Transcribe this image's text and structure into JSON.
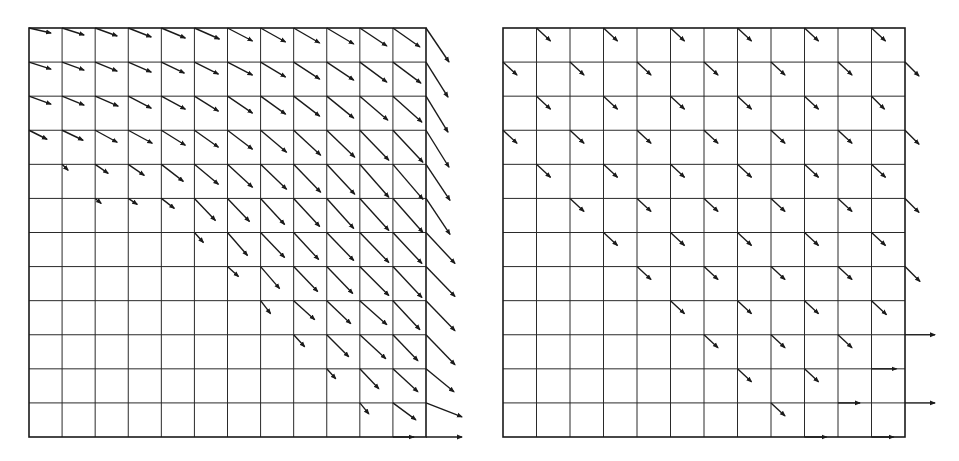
{
  "figure": {
    "stroke_color": "#1a1a1a",
    "background": "#ffffff",
    "panels": [
      {
        "id": "left",
        "name": "dense-vector-field",
        "x0": 29,
        "y0": 28,
        "x1": 426,
        "y1": 437,
        "cols": 12,
        "rows": 12,
        "nodes_comment": "vectors[row][col] = [dx, dy] in px, row 0 = top; null = no arrow",
        "vectors": [
          [
            [
              22,
              5
            ],
            [
              22,
              7
            ],
            [
              22,
              8
            ],
            [
              23,
              9
            ],
            [
              24,
              10
            ],
            [
              25,
              11
            ],
            [
              25,
              13
            ],
            [
              25,
              14
            ],
            [
              26,
              15
            ],
            [
              27,
              16
            ],
            [
              27,
              18
            ],
            [
              27,
              19
            ],
            [
              23,
              34
            ]
          ],
          [
            [
              22,
              7
            ],
            [
              22,
              8
            ],
            [
              22,
              9
            ],
            [
              23,
              10
            ],
            [
              23,
              11
            ],
            [
              24,
              12
            ],
            [
              25,
              13
            ],
            [
              25,
              15
            ],
            [
              26,
              17
            ],
            [
              27,
              18
            ],
            [
              27,
              20
            ],
            [
              28,
              21
            ],
            [
              22,
              35
            ]
          ],
          [
            [
              22,
              8
            ],
            [
              22,
              9
            ],
            [
              23,
              10
            ],
            [
              23,
              12
            ],
            [
              24,
              13
            ],
            [
              24,
              15
            ],
            [
              25,
              17
            ],
            [
              25,
              18
            ],
            [
              26,
              20
            ],
            [
              27,
              22
            ],
            [
              28,
              24
            ],
            [
              29,
              26
            ],
            [
              22,
              36
            ]
          ],
          [
            [
              18,
              9
            ],
            [
              21,
              10
            ],
            [
              22,
              12
            ],
            [
              24,
              13
            ],
            [
              24,
              15
            ],
            [
              24,
              17
            ],
            [
              25,
              19
            ],
            [
              26,
              22
            ],
            [
              27,
              25
            ],
            [
              28,
              27
            ],
            [
              29,
              30
            ],
            [
              30,
              32
            ],
            [
              23,
              37
            ]
          ],
          [
            null,
            [
              6,
              6
            ],
            [
              13,
              9
            ],
            [
              16,
              11
            ],
            [
              22,
              17
            ],
            [
              24,
              20
            ],
            [
              25,
              23
            ],
            [
              26,
              25
            ],
            [
              27,
              28
            ],
            [
              28,
              30
            ],
            [
              29,
              33
            ],
            [
              30,
              35
            ],
            [
              24,
              36
            ]
          ],
          [
            null,
            null,
            [
              6,
              5
            ],
            [
              9,
              6
            ],
            [
              13,
              10
            ],
            [
              21,
              22
            ],
            [
              22,
              23
            ],
            [
              24,
              26
            ],
            [
              26,
              28
            ],
            [
              27,
              30
            ],
            [
              29,
              32
            ],
            [
              30,
              34
            ],
            [
              24,
              36
            ]
          ],
          [
            null,
            null,
            null,
            null,
            null,
            [
              9,
              10
            ],
            [
              20,
              23
            ],
            [
              24,
              25
            ],
            [
              25,
              27
            ],
            [
              27,
              28
            ],
            [
              29,
              30
            ],
            [
              29,
              31
            ],
            [
              29,
              31
            ]
          ],
          [
            null,
            null,
            null,
            null,
            null,
            null,
            [
              11,
              10
            ],
            [
              19,
              22
            ],
            [
              24,
              25
            ],
            [
              26,
              27
            ],
            [
              29,
              29
            ],
            [
              29,
              31
            ],
            [
              29,
              30
            ]
          ],
          [
            null,
            null,
            null,
            null,
            null,
            null,
            null,
            [
              10,
              13
            ],
            [
              21,
              19
            ],
            [
              24,
              23
            ],
            [
              27,
              24
            ],
            [
              27,
              29
            ],
            [
              29,
              30
            ]
          ],
          [
            null,
            null,
            null,
            null,
            null,
            null,
            null,
            null,
            [
              11,
              12
            ],
            [
              22,
              22
            ],
            [
              26,
              24
            ],
            [
              25,
              26
            ],
            [
              29,
              30
            ]
          ],
          [
            null,
            null,
            null,
            null,
            null,
            null,
            null,
            null,
            null,
            [
              9,
              10
            ],
            [
              19,
              20
            ],
            [
              25,
              23
            ],
            [
              28,
              23
            ]
          ],
          [
            null,
            null,
            null,
            null,
            null,
            null,
            null,
            null,
            null,
            null,
            [
              9,
              11
            ],
            [
              23,
              17
            ],
            [
              36,
              14
            ]
          ],
          [
            null,
            null,
            null,
            null,
            null,
            null,
            null,
            null,
            null,
            null,
            [
              0,
              0
            ],
            [
              21,
              0
            ],
            [
              36,
              0
            ]
          ]
        ]
      },
      {
        "id": "right",
        "name": "staggered-vector-field",
        "x0": 503,
        "y0": 28,
        "x1": 905,
        "y1": 437,
        "cols": 12,
        "rows": 12,
        "nodes_comment": "vectors[row][col] = [dx, dy] in px, row 0 = top; null = no arrow",
        "vectors": [
          [
            null,
            [
              14,
              13
            ],
            null,
            [
              14,
              13
            ],
            null,
            [
              14,
              13
            ],
            null,
            [
              14,
              13
            ],
            null,
            [
              14,
              13
            ],
            null,
            [
              14,
              13
            ],
            null
          ],
          [
            [
              14,
              13
            ],
            null,
            [
              14,
              13
            ],
            null,
            [
              14,
              13
            ],
            null,
            [
              14,
              13
            ],
            null,
            [
              14,
              13
            ],
            null,
            [
              14,
              13
            ],
            null,
            [
              14,
              14
            ]
          ],
          [
            null,
            [
              14,
              13
            ],
            null,
            [
              14,
              13
            ],
            null,
            [
              14,
              13
            ],
            null,
            [
              14,
              13
            ],
            null,
            [
              14,
              13
            ],
            null,
            [
              13,
              13
            ],
            null
          ],
          [
            [
              14,
              13
            ],
            null,
            [
              14,
              13
            ],
            null,
            [
              14,
              13
            ],
            null,
            [
              14,
              13
            ],
            null,
            [
              14,
              13
            ],
            null,
            [
              14,
              13
            ],
            null,
            [
              14,
              14
            ]
          ],
          [
            null,
            [
              14,
              13
            ],
            null,
            [
              14,
              13
            ],
            null,
            [
              14,
              13
            ],
            null,
            [
              14,
              13
            ],
            null,
            [
              14,
              13
            ],
            null,
            [
              14,
              13
            ],
            null
          ],
          [
            null,
            null,
            [
              14,
              13
            ],
            null,
            [
              14,
              13
            ],
            null,
            [
              14,
              13
            ],
            null,
            [
              14,
              13
            ],
            null,
            [
              14,
              13
            ],
            null,
            [
              14,
              14
            ]
          ],
          [
            null,
            null,
            null,
            [
              14,
              13
            ],
            null,
            [
              14,
              13
            ],
            null,
            [
              14,
              13
            ],
            null,
            [
              14,
              13
            ],
            null,
            [
              14,
              13
            ],
            null
          ],
          [
            null,
            null,
            null,
            null,
            [
              14,
              13
            ],
            null,
            [
              14,
              13
            ],
            null,
            [
              14,
              13
            ],
            null,
            [
              14,
              13
            ],
            null,
            [
              15,
              15
            ]
          ],
          [
            null,
            null,
            null,
            null,
            null,
            [
              14,
              13
            ],
            null,
            [
              14,
              13
            ],
            null,
            [
              14,
              13
            ],
            null,
            [
              15,
              14
            ],
            null
          ],
          [
            null,
            null,
            null,
            null,
            null,
            null,
            [
              14,
              13
            ],
            null,
            [
              14,
              13
            ],
            null,
            [
              14,
              13
            ],
            null,
            [
              30,
              0
            ]
          ],
          [
            null,
            null,
            null,
            null,
            null,
            null,
            null,
            [
              14,
              13
            ],
            null,
            [
              14,
              13
            ],
            null,
            [
              25,
              0
            ],
            null
          ],
          [
            null,
            null,
            null,
            null,
            null,
            null,
            null,
            null,
            [
              14,
              13
            ],
            null,
            [
              22,
              0
            ],
            null,
            [
              30,
              0
            ]
          ],
          [
            null,
            null,
            null,
            null,
            null,
            null,
            null,
            null,
            null,
            [
              22,
              0
            ],
            null,
            [
              22,
              0
            ],
            null
          ]
        ]
      }
    ]
  }
}
